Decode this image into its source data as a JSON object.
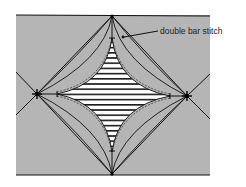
{
  "diagram": {
    "annotation": {
      "text": "double bar stitch",
      "x": 160,
      "y": 26
    },
    "colors": {
      "background": "#ffffff",
      "fabric": "#b5b5b5",
      "line": "#111111",
      "stripe_white": "#ffffff",
      "stripe_dark": "#1a1a1a"
    }
  }
}
